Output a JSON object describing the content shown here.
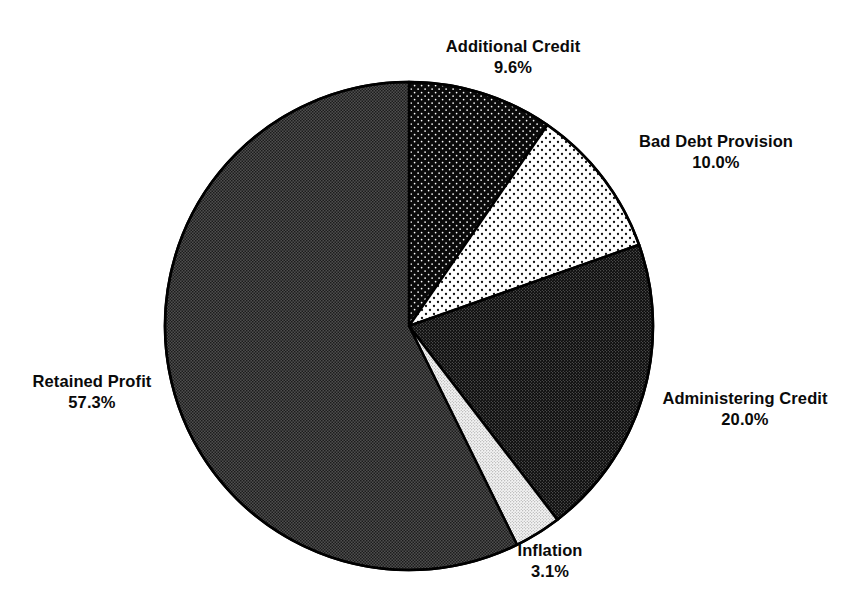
{
  "chart_data": {
    "type": "pie",
    "title": "",
    "subtitle": "",
    "xlabel": "",
    "ylabel": "",
    "legend_position": "none",
    "grid": false,
    "labels_outside": true,
    "start_angle_deg": 0,
    "direction": "clockwise",
    "categories": [
      "Additional Credit",
      "Bad Debt Provision",
      "Administering Credit",
      "Inflation",
      "Retained Profit"
    ],
    "values": [
      9.6,
      10.0,
      20.0,
      3.1,
      57.3
    ],
    "value_unit": "%",
    "slices": [
      {
        "label": "Additional Credit",
        "percent_text": "9.6%",
        "value": 9.6,
        "fill_style": "black-with-white-dots",
        "base_color": "#0a0a0a",
        "dot_color": "#ffffff",
        "start_deg": 0.0,
        "end_deg": 34.56
      },
      {
        "label": "Bad Debt Provision",
        "percent_text": "10.0%",
        "value": 10.0,
        "fill_style": "white-with-black-dots",
        "base_color": "#ffffff",
        "dot_color": "#0a0a0a",
        "start_deg": 34.56,
        "end_deg": 70.56
      },
      {
        "label": "Administering Credit",
        "percent_text": "20.0%",
        "value": 20.0,
        "fill_style": "dark-fine-dots",
        "base_color": "#111111",
        "dot_color": "#8a8a8a",
        "start_deg": 70.56,
        "end_deg": 142.56
      },
      {
        "label": "Inflation",
        "percent_text": "3.1%",
        "value": 3.1,
        "fill_style": "light-fine-dots",
        "base_color": "#f2f2f2",
        "dot_color": "#8a8a8a",
        "start_deg": 142.56,
        "end_deg": 153.72
      },
      {
        "label": "Retained Profit",
        "percent_text": "57.3%",
        "value": 57.3,
        "fill_style": "mid-gray-checker",
        "base_color": "#4a4a4a",
        "dot_color": "#1a1a1a",
        "start_deg": 153.72,
        "end_deg": 360.0
      }
    ],
    "geometry": {
      "center_x": 409,
      "center_y": 326,
      "radius": 244,
      "outline_color": "#000000",
      "outline_width": 2.5
    },
    "background_color": "#ffffff"
  },
  "labels": {
    "additional_credit": {
      "name": "Additional Credit",
      "pct": "9.6%"
    },
    "bad_debt": {
      "name": "Bad Debt Provision",
      "pct": "10.0%"
    },
    "administering": {
      "name": "Administering Credit",
      "pct": "20.0%"
    },
    "inflation": {
      "name": "Inflation",
      "pct": "3.1%"
    },
    "retained_profit": {
      "name": "Retained Profit",
      "pct": "57.3%"
    }
  }
}
